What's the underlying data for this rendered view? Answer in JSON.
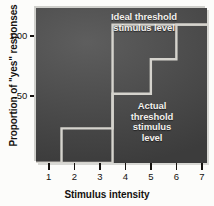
{
  "chart_data": {
    "type": "line",
    "subtype": "step",
    "title": "",
    "xlabel": "Stimulus intensity",
    "ylabel": "Proportion of \"yes\" responses",
    "xlim": [
      0.5,
      7.2
    ],
    "ylim": [
      0.0,
      1.12
    ],
    "xticks": [
      1,
      2,
      3,
      4,
      5,
      6,
      7
    ],
    "xticklabels": [
      "1",
      "2",
      "3",
      "4",
      "5",
      "6",
      "7"
    ],
    "yticks": [
      0.5,
      1.0
    ],
    "yticklabels": [
      ".50",
      "1.00"
    ],
    "grid": false,
    "legend": "none",
    "background_color": "#4a4a4a",
    "line_color": "#d5d3cd",
    "series": [
      {
        "name": "Ideal threshold stimulus level",
        "x": [
          0.5,
          3.5,
          3.5,
          7.2
        ],
        "y": [
          0.0,
          0.0,
          1.0,
          1.0
        ]
      },
      {
        "name": "Actual threshold stimulus level",
        "x": [
          0.5,
          1.5,
          1.5,
          3.5,
          3.5,
          5.0,
          5.0,
          6.0,
          6.0,
          7.2
        ],
        "y": [
          0.0,
          0.0,
          0.25,
          0.25,
          0.5,
          0.5,
          0.75,
          0.75,
          1.0,
          1.0
        ]
      }
    ],
    "annotations": [
      {
        "name": "ideal-threshold-label",
        "lines": [
          "Ideal threshold",
          "stimulus level"
        ],
        "x": 3.4,
        "y": 1.07
      },
      {
        "name": "actual-threshold-label",
        "lines": [
          "Actual",
          "threshold",
          "stimulus",
          "level"
        ],
        "x": 4.9,
        "y": 0.42
      }
    ]
  },
  "axes": {
    "y_title": "Proportion of \"yes\" responses",
    "x_title": "Stimulus intensity",
    "y_tick_labels": [
      "1.00",
      ".50"
    ],
    "x_tick_labels": [
      "1",
      "2",
      "3",
      "4",
      "5",
      "6",
      "7"
    ]
  },
  "annotations": {
    "ideal": [
      "Ideal threshold",
      "stimulus level"
    ],
    "actual": [
      "Actual",
      "threshold",
      "stimulus",
      "level"
    ]
  },
  "colors": {
    "plot_background": "#4a4a4a",
    "curve": "#d5d3cd",
    "text_dark": "#15120f",
    "text_light": "#f2f0ec",
    "page_background": "#fcfcfa"
  }
}
